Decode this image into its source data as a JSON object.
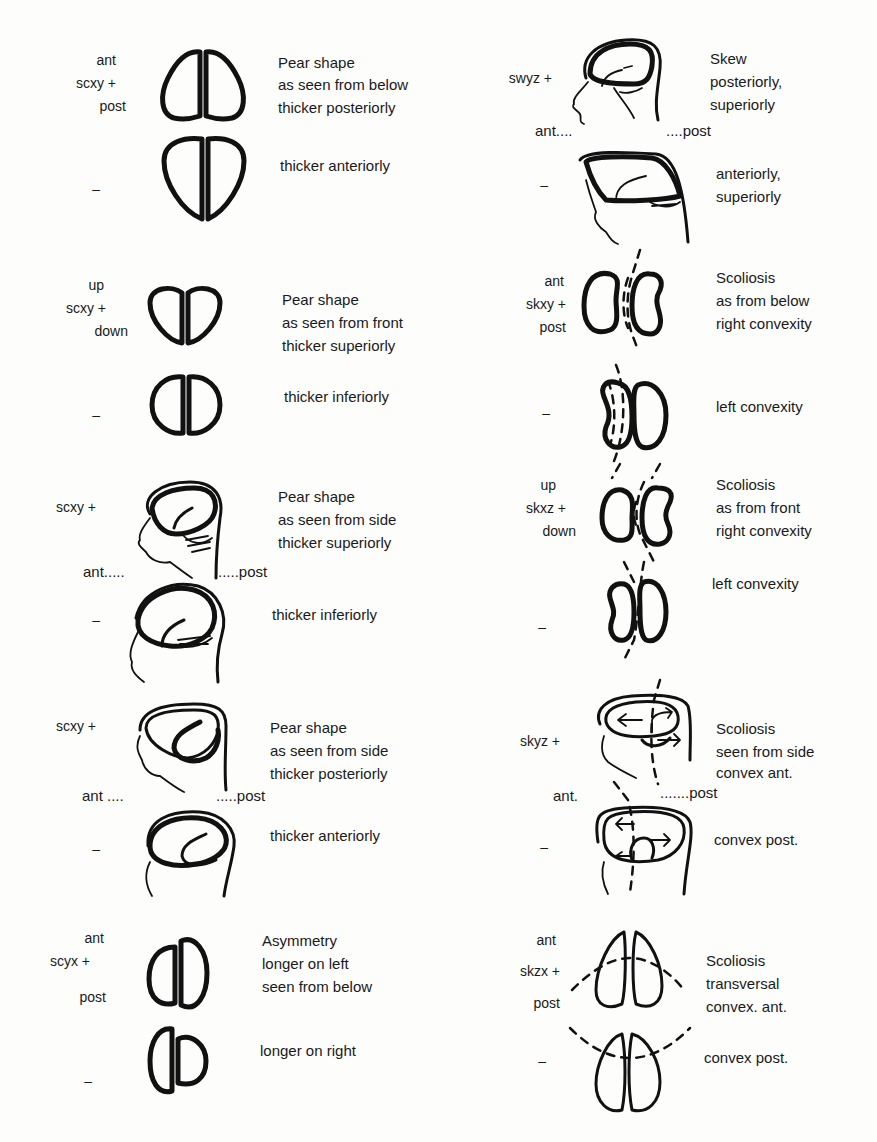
{
  "figure": {
    "left_column": [
      {
        "id": "scxy-below",
        "plus": {
          "labels": [
            "ant",
            "scxy +",
            "post"
          ],
          "description": [
            "Pear shape",
            "as seen from below",
            "thicker posteriorly"
          ]
        },
        "minus": {
          "labels": [
            "–"
          ],
          "description": [
            "thicker anteriorly"
          ]
        }
      },
      {
        "id": "scxy-front",
        "plus": {
          "labels": [
            "up",
            "scxy +",
            "down"
          ],
          "description": [
            "Pear shape",
            "as seen from front",
            "thicker superiorly"
          ]
        },
        "minus": {
          "labels": [
            "–"
          ],
          "description": [
            "thicker inferiorly"
          ]
        }
      },
      {
        "id": "scxy-side-superior",
        "plus": {
          "labels": [
            "scxy +"
          ],
          "description": [
            "Pear shape",
            "as seen from side",
            "thicker superiorly"
          ]
        },
        "axis": {
          "ant": "ant.....",
          "post": ".....post"
        },
        "minus": {
          "labels": [
            "–"
          ],
          "description": [
            "thicker inferiorly"
          ]
        }
      },
      {
        "id": "scxy-side-posterior",
        "plus": {
          "labels": [
            "scxy +"
          ],
          "description": [
            "Pear shape",
            "as seen from side",
            "thicker posteriorly"
          ]
        },
        "axis": {
          "ant": "ant ....",
          "post": ".....post"
        },
        "minus": {
          "labels": [
            "–"
          ],
          "description": [
            "thicker anteriorly"
          ]
        }
      },
      {
        "id": "scyx-asymmetry",
        "plus": {
          "labels": [
            "ant",
            "scyx +",
            "post"
          ],
          "description": [
            "Asymmetry",
            "longer on left",
            "seen from below"
          ]
        },
        "minus": {
          "labels": [
            "–"
          ],
          "description": [
            "longer on right"
          ]
        }
      }
    ],
    "right_column": [
      {
        "id": "swyz-skew",
        "plus": {
          "labels": [
            "swyz +"
          ],
          "description": [
            "Skew",
            "posteriorly,",
            "superiorly"
          ]
        },
        "axis": {
          "ant": "ant....",
          "post": "....post"
        },
        "minus": {
          "labels": [
            "–"
          ],
          "description": [
            "anteriorly,",
            "superiorly"
          ]
        }
      },
      {
        "id": "skxy-scoliosis-below",
        "plus": {
          "labels": [
            "ant",
            "skxy +",
            "post"
          ],
          "description": [
            "Scoliosis",
            "as from below",
            "right convexity"
          ]
        },
        "minus": {
          "labels": [
            "–"
          ],
          "description": [
            "left convexity"
          ]
        }
      },
      {
        "id": "skxz-scoliosis-front",
        "plus": {
          "labels": [
            "up",
            "skxz +",
            "down"
          ],
          "description": [
            "Scoliosis",
            "as from front",
            "right convexity"
          ]
        },
        "minus": {
          "labels": [
            "–"
          ],
          "description": [
            "left convexity"
          ]
        }
      },
      {
        "id": "skyz-scoliosis-side",
        "plus": {
          "labels": [
            "skyz +"
          ],
          "description": [
            "Scoliosis",
            "seen from side",
            "convex ant."
          ]
        },
        "axis": {
          "ant": "ant.",
          "post": ".......post"
        },
        "minus": {
          "labels": [
            "–"
          ],
          "description": [
            "convex post."
          ]
        }
      },
      {
        "id": "skzx-scoliosis-transversal",
        "plus": {
          "labels": [
            "ant",
            "skzx +",
            "post"
          ],
          "description": [
            "Scoliosis",
            "transversal",
            "convex. ant."
          ]
        },
        "minus": {
          "labels": [
            "–"
          ],
          "description": [
            "convex post."
          ]
        }
      }
    ]
  }
}
